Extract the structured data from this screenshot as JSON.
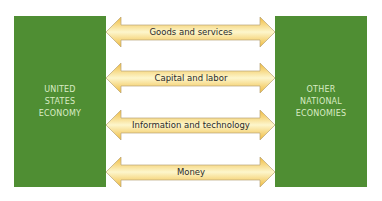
{
  "diagram": {
    "left_box": {
      "label": "UNITED\nSTATES\nECONOMY"
    },
    "right_box": {
      "label": "OTHER\nNATIONAL\nECONOMIES"
    },
    "flows": [
      {
        "label": "Goods and services",
        "direction": "bidirectional"
      },
      {
        "label": "Capital and labor",
        "direction": "bidirectional"
      },
      {
        "label": "Information and technology",
        "direction": "bidirectional"
      },
      {
        "label": "Money",
        "direction": "bidirectional"
      }
    ],
    "colors": {
      "box_fill": "#4f8e33",
      "box_text": "#d9ecc4",
      "arrow_edge": "#f0bb3e",
      "arrow_center": "#fdf6cc",
      "arrow_outline": "#b8a57a"
    }
  }
}
